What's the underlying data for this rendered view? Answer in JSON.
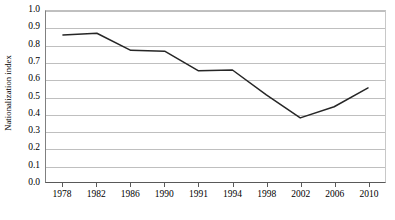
{
  "chart_data": {
    "type": "line",
    "title": "",
    "xlabel": "",
    "ylabel": "Nationalization index",
    "categories": [
      "1978",
      "1982",
      "1986",
      "1990",
      "1991",
      "1994",
      "1998",
      "2002",
      "2006",
      "2010"
    ],
    "values": [
      0.86,
      0.87,
      0.77,
      0.765,
      0.65,
      0.655,
      0.51,
      0.375,
      0.44,
      0.55
    ],
    "series": [
      {
        "name": "Nationalization index",
        "values": [
          0.86,
          0.87,
          0.77,
          0.765,
          0.65,
          0.655,
          0.51,
          0.375,
          0.44,
          0.55
        ]
      }
    ],
    "ylim": [
      0.0,
      1.0
    ],
    "ytick_labels": [
      "1.0",
      "0.9",
      "0.8",
      "0.7",
      "0.6",
      "0.5",
      "0.4",
      "0.3",
      "0.2",
      "0.1",
      "0.0"
    ],
    "ytick_values": [
      1.0,
      0.9,
      0.8,
      0.7,
      0.6,
      0.5,
      0.4,
      0.3,
      0.2,
      0.1,
      0.0
    ],
    "grid": "horizontal",
    "legend": "none",
    "line_color": "#262626",
    "grid_color": "#bfbfbf",
    "axis_color": "#595959",
    "background_color": "#ffffff",
    "markers": "none"
  }
}
